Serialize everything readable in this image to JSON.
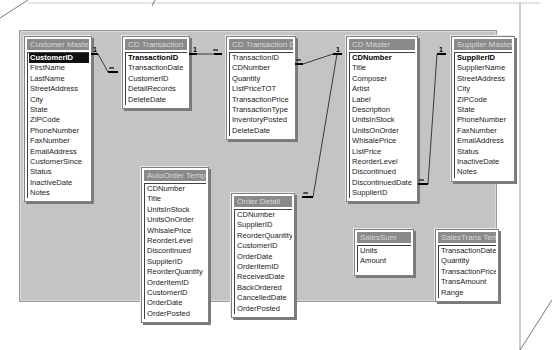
{
  "diagram": {
    "tables": [
      {
        "id": "customer-master",
        "name": "Customer Master",
        "primary_key": "CustomerID",
        "fields": [
          "CustomerID",
          "FirstName",
          "LastName",
          "StreetAddress",
          "City",
          "State",
          "ZIPCode",
          "PhoneNumber",
          "FaxNumber",
          "EmailAddress",
          "CustomerSince",
          "Status",
          "InactiveDate",
          "Notes"
        ]
      },
      {
        "id": "cd-transaction",
        "name": "CD Transaction",
        "primary_key": "TransactionID",
        "fields": [
          "TransactionID",
          "TransactionDate",
          "CustomerID",
          "DetailRecords",
          "DeleteDate"
        ]
      },
      {
        "id": "cd-transaction-detail",
        "name": "CD Transaction Detail",
        "primary_key": "",
        "fields": [
          "TransactionID",
          "CDNumber",
          "Quantity",
          "ListPriceTOT",
          "TransactionPrice",
          "TransactionType",
          "InventoryPosted",
          "DeleteDate"
        ]
      },
      {
        "id": "cd-master",
        "name": "CD Master",
        "primary_key": "CDNumber",
        "fields": [
          "CDNumber",
          "Title",
          "Composer",
          "Artist",
          "Label",
          "Description",
          "UnitsInStock",
          "UnitsOnOrder",
          "WhlsalePrice",
          "ListPrice",
          "ReorderLevel",
          "Discontinued",
          "DiscontinuedDate",
          "SupplierID"
        ]
      },
      {
        "id": "supplier-master",
        "name": "Supplier Master",
        "primary_key": "SupplierID",
        "fields": [
          "SupplierID",
          "SupplierName",
          "StreetAddress",
          "City",
          "ZIPCode",
          "State",
          "PhoneNumber",
          "FaxNumber",
          "EmailAddress",
          "Status",
          "InactiveDate",
          "Notes"
        ]
      },
      {
        "id": "autoorder-temp",
        "name": "AutoOrder Temp",
        "primary_key": "",
        "fields": [
          "CDNumber",
          "Title",
          "UnitsInStock",
          "UnitsOnOrder",
          "WhlsalePrice",
          "ReorderLevel",
          "Discontinued",
          "SupplierID",
          "ReorderQuantity",
          "OrderItemID",
          "CustomerID",
          "OrderDate",
          "OrderPosted"
        ]
      },
      {
        "id": "order-detail",
        "name": "Order Detail",
        "primary_key": "",
        "fields": [
          "CDNumber",
          "SupplierID",
          "ReorderQuantity",
          "CustomerID",
          "OrderDate",
          "OrderItemID",
          "ReceivedDate",
          "BackOrdered",
          "CancelledDate",
          "OrderPosted"
        ]
      },
      {
        "id": "salessum",
        "name": "SalesSum",
        "primary_key": "",
        "fields": [
          "Units",
          "Amount"
        ]
      },
      {
        "id": "salestrans-temp",
        "name": "SalesTrans Temp",
        "primary_key": "",
        "fields": [
          "TransactionDate",
          "Quantity",
          "TransactionPrice",
          "TransAmount",
          "Range"
        ]
      }
    ],
    "relationships": [
      {
        "from": "Customer Master.CustomerID",
        "to": "CD Transaction.CustomerID",
        "one": "1",
        "many": "∞"
      },
      {
        "from": "CD Transaction.TransactionID",
        "to": "CD Transaction Detail.TransactionID",
        "one": "1",
        "many": "∞"
      },
      {
        "from": "CD Master.CDNumber",
        "to": "CD Transaction Detail.CDNumber",
        "one": "1",
        "many": "∞"
      },
      {
        "from": "CD Master.CDNumber",
        "to": "Order Detail.CDNumber",
        "one": "1",
        "many": "∞"
      },
      {
        "from": "Supplier Master.SupplierID",
        "to": "CD Master.SupplierID",
        "one": "1",
        "many": "∞"
      }
    ]
  }
}
